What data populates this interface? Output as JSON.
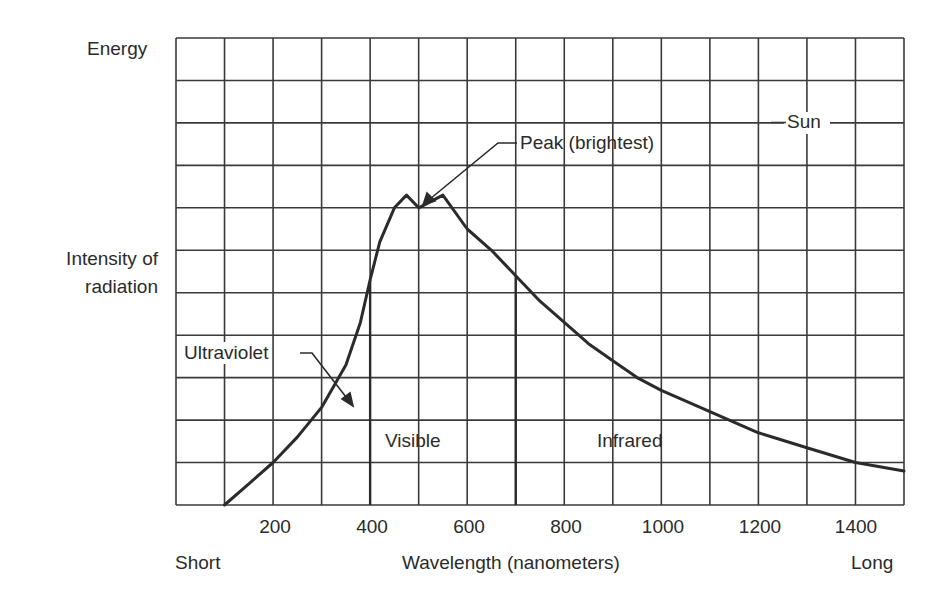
{
  "chart_data": {
    "type": "line",
    "title": "",
    "xlabel": "Wavelength (nanometers)",
    "ylabel": "Intensity of radiation",
    "y_axis_top_label": "Energy",
    "x_axis_left_label": "Short",
    "x_axis_right_label": "Long",
    "xlim": [
      0,
      1500
    ],
    "ylim": [
      0,
      11
    ],
    "x_ticks": [
      200,
      400,
      600,
      800,
      1000,
      1200,
      1400
    ],
    "x_tick_labels": [
      "200",
      "400",
      "600",
      "800",
      "1000",
      "1200",
      "1400"
    ],
    "grid": true,
    "grid_columns": 15,
    "grid_rows": 11,
    "series": [
      {
        "name": "Sun",
        "x": [
          100,
          150,
          200,
          250,
          300,
          350,
          380,
          400,
          420,
          450,
          475,
          500,
          550,
          600,
          650,
          700,
          750,
          800,
          850,
          900,
          950,
          1000,
          1100,
          1200,
          1300,
          1400,
          1500
        ],
        "y": [
          0.0,
          0.5,
          1.0,
          1.6,
          2.3,
          3.3,
          4.3,
          5.3,
          6.2,
          7.0,
          7.3,
          7.0,
          7.3,
          6.5,
          6.0,
          5.4,
          4.8,
          4.3,
          3.8,
          3.4,
          3.0,
          2.7,
          2.2,
          1.7,
          1.35,
          1.0,
          0.8
        ]
      }
    ],
    "regions": [
      {
        "name": "Ultraviolet",
        "x_range": [
          0,
          400
        ]
      },
      {
        "name": "Visible",
        "x_range": [
          400,
          700
        ]
      },
      {
        "name": "Infrared",
        "x_range": [
          700,
          1500
        ]
      }
    ],
    "boundaries": [
      400,
      700
    ],
    "annotations": [
      {
        "text": "Peak (brightest)",
        "x": 500,
        "y": 7.0
      },
      {
        "text": "Ultraviolet",
        "x": 370,
        "y": 2.4
      },
      {
        "text": "Sun",
        "x": 1300,
        "y": 9
      }
    ]
  },
  "labels": {
    "energy": "Energy",
    "ylabel_line1": "Intensity of",
    "ylabel_line2": "radiation",
    "short": "Short",
    "long": "Long",
    "xlabel": "Wavelength (nanometers)",
    "visible": "Visible",
    "infrared": "Infrared",
    "ultraviolet": "Ultraviolet",
    "peak": "Peak (brightest)",
    "sun": "Sun",
    "ticks": [
      "200",
      "400",
      "600",
      "800",
      "1000",
      "1200",
      "1400"
    ]
  },
  "colors": {
    "ink": "#2b2b2b",
    "background": "#ffffff"
  }
}
